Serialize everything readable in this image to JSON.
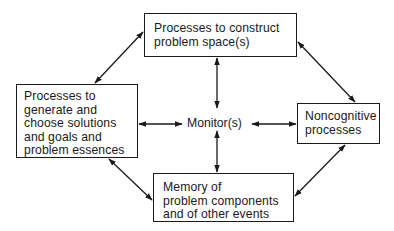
{
  "diagram": {
    "type": "flowchart",
    "nodes": {
      "top": {
        "lines": [
          "Processes to construct",
          "problem space(s)"
        ]
      },
      "left": {
        "lines": [
          "Processes to",
          "generate and",
          "choose solutions",
          "and goals and",
          "problem essences"
        ]
      },
      "center": {
        "label": "Monitor(s)"
      },
      "right": {
        "lines": [
          "Noncognitive",
          "processes"
        ]
      },
      "bottom": {
        "lines": [
          "Memory of",
          "problem components",
          "and of other events"
        ]
      }
    },
    "edges": [
      {
        "from": "center",
        "to": "top",
        "direction": "bidirectional"
      },
      {
        "from": "center",
        "to": "bottom",
        "direction": "bidirectional"
      },
      {
        "from": "center",
        "to": "left",
        "direction": "bidirectional"
      },
      {
        "from": "center",
        "to": "right",
        "direction": "bidirectional"
      },
      {
        "from": "left",
        "to": "top",
        "direction": "bidirectional"
      },
      {
        "from": "top",
        "to": "right",
        "direction": "bidirectional"
      },
      {
        "from": "left",
        "to": "bottom",
        "direction": "bidirectional"
      },
      {
        "from": "bottom",
        "to": "right",
        "direction": "bidirectional"
      }
    ],
    "colors": {
      "line": "#1a1a1a",
      "background": "#ffffff"
    }
  }
}
